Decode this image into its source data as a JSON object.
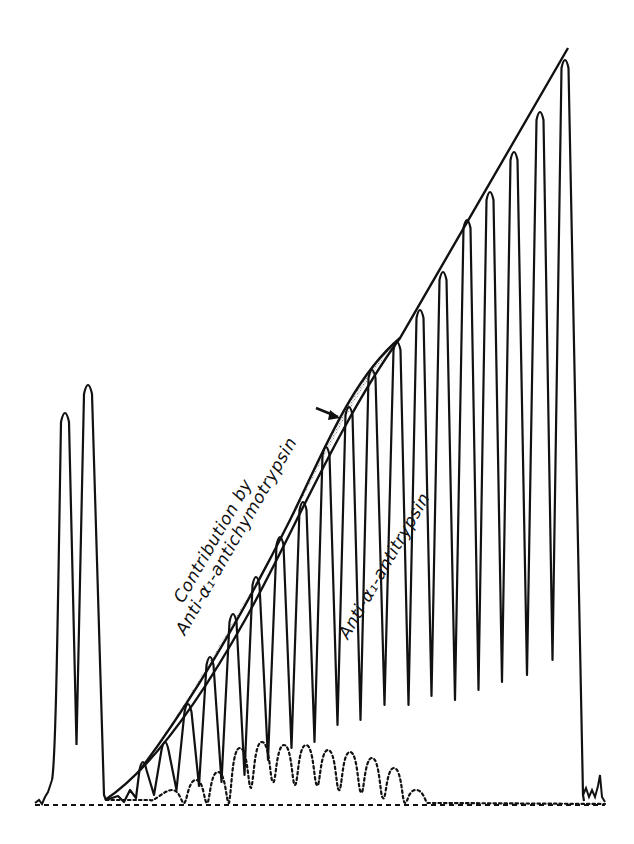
{
  "figure": {
    "type": "densitometric scan trace",
    "labels": {
      "contribution_line1": "Contribution by",
      "contribution_line2": "Anti-α₁-antichymotrypsin",
      "antitrypsin": "Anti-α₁-antitrypsin"
    },
    "colors": {
      "ink": "#111111",
      "background": "#ffffff",
      "stipple": "#9a9a9a"
    },
    "baseline_y": 805,
    "left_peaks": [
      {
        "x": 65,
        "top": 410
      },
      {
        "x": 88,
        "top": 382
      }
    ],
    "left_valley": 745,
    "sweep_peaks": [
      {
        "x": 143,
        "top": 760,
        "trough": 795
      },
      {
        "x": 165,
        "top": 740,
        "trough": 790
      },
      {
        "x": 188,
        "top": 702,
        "trough": 786
      },
      {
        "x": 210,
        "top": 655,
        "trough": 782
      },
      {
        "x": 233,
        "top": 612,
        "trough": 775
      },
      {
        "x": 256,
        "top": 575,
        "trough": 760
      },
      {
        "x": 280,
        "top": 535,
        "trough": 748
      },
      {
        "x": 303,
        "top": 500,
        "trough": 742
      },
      {
        "x": 326,
        "top": 445,
        "trough": 725
      },
      {
        "x": 349,
        "top": 405,
        "trough": 720
      },
      {
        "x": 372,
        "top": 368,
        "trough": 705
      },
      {
        "x": 397,
        "top": 340,
        "trough": 705
      },
      {
        "x": 420,
        "top": 308,
        "trough": 696
      },
      {
        "x": 443,
        "top": 270,
        "trough": 700
      },
      {
        "x": 467,
        "top": 218,
        "trough": 690
      },
      {
        "x": 490,
        "top": 190,
        "trough": 682
      },
      {
        "x": 514,
        "top": 150,
        "trough": 675
      },
      {
        "x": 540,
        "top": 110,
        "trough": 660
      },
      {
        "x": 565,
        "top": 58,
        "trough": 660
      }
    ],
    "sweep_end_x": 583,
    "dotted_bumps": [
      {
        "x": 172,
        "top": 790
      },
      {
        "x": 196,
        "top": 780
      },
      {
        "x": 218,
        "top": 772
      },
      {
        "x": 240,
        "top": 748
      },
      {
        "x": 262,
        "top": 742
      },
      {
        "x": 284,
        "top": 745
      },
      {
        "x": 306,
        "top": 745
      },
      {
        "x": 328,
        "top": 750
      },
      {
        "x": 350,
        "top": 752
      },
      {
        "x": 372,
        "top": 758
      },
      {
        "x": 394,
        "top": 768
      },
      {
        "x": 416,
        "top": 790
      }
    ]
  }
}
